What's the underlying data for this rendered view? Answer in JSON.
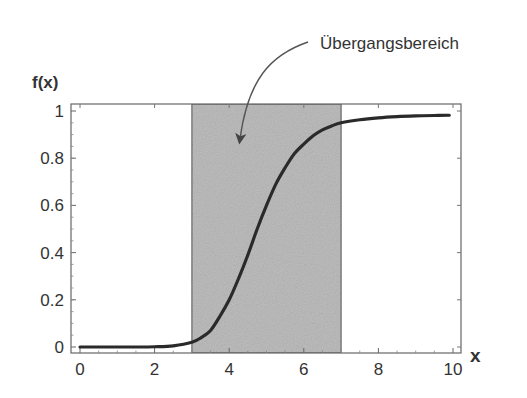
{
  "chart_data": {
    "type": "line",
    "title": "",
    "xlabel": "x",
    "ylabel": "f(x)",
    "xlim": [
      -0.3,
      10.2
    ],
    "ylim": [
      -0.025,
      1.03
    ],
    "x_ticks": [
      0,
      2,
      4,
      6,
      8,
      10
    ],
    "x_tick_labels": [
      "0",
      "2",
      "4",
      "6",
      "8",
      "10"
    ],
    "y_ticks": [
      0,
      0.2,
      0.4,
      0.6,
      0.8,
      1
    ],
    "y_tick_labels": [
      "0",
      "0.2",
      "0.4",
      "0.6",
      "0.8",
      "1"
    ],
    "grid": false,
    "legend": null,
    "series": [
      {
        "name": "f(x)",
        "x": [
          0,
          0.5,
          1,
          1.5,
          2,
          2.5,
          3,
          3.25,
          3.5,
          3.75,
          4,
          4.25,
          4.5,
          4.75,
          5,
          5.25,
          5.5,
          5.75,
          6,
          6.25,
          6.5,
          6.75,
          7,
          7.5,
          8,
          8.5,
          9,
          9.5,
          9.9
        ],
        "values": [
          0,
          0,
          0,
          0,
          0.001,
          0.005,
          0.02,
          0.04,
          0.07,
          0.13,
          0.2,
          0.29,
          0.39,
          0.5,
          0.6,
          0.69,
          0.76,
          0.82,
          0.86,
          0.895,
          0.92,
          0.937,
          0.95,
          0.963,
          0.971,
          0.976,
          0.979,
          0.981,
          0.982
        ]
      }
    ],
    "shaded_region": {
      "x_start": 3,
      "x_end": 7,
      "label": "Übergangsbereich"
    },
    "annotations": [
      {
        "text": "Übergangsbereich",
        "arrow_to": {
          "x": 4.3,
          "y": 0.87
        }
      }
    ]
  },
  "labels": {
    "y_axis": "f(x)",
    "x_axis": "x",
    "annotation": "Übergangsbereich"
  },
  "colors": {
    "curve": "#2a2a2a",
    "frame": "#666666",
    "shade": "#bdbdbd",
    "text": "#333333"
  }
}
